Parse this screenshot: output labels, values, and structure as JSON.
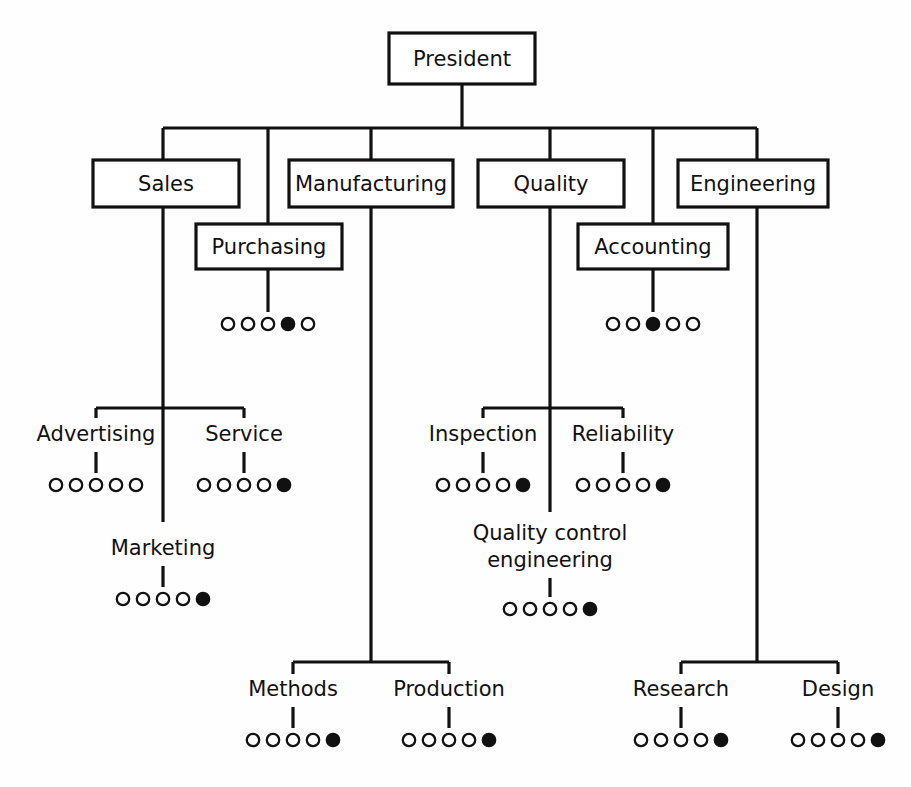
{
  "chart_data": {
    "type": "diagram",
    "diagram_type": "organization-chart",
    "line_color": "#111111",
    "box_fill": "#ffffff",
    "background": "#fefefe",
    "dot_legend": {
      "open_symbol": "open circle",
      "filled_symbol": "filled circle",
      "dots_per_group": 5
    },
    "root": {
      "id": "president",
      "label": "President",
      "style": "box"
    },
    "level2": [
      {
        "id": "sales",
        "label": "Sales",
        "style": "box"
      },
      {
        "id": "purchasing",
        "label": "Purchasing",
        "style": "box"
      },
      {
        "id": "manufacturing",
        "label": "Manufacturing",
        "style": "box"
      },
      {
        "id": "quality",
        "label": "Quality",
        "style": "box"
      },
      {
        "id": "accounting",
        "label": "Accounting",
        "style": "box"
      },
      {
        "id": "engineering",
        "label": "Engineering",
        "style": "box"
      }
    ],
    "leaves": [
      {
        "id": "purchasing-rating",
        "parent": "purchasing",
        "label": "",
        "dots": 5,
        "filled_index": 4
      },
      {
        "id": "accounting-rating",
        "parent": "accounting",
        "label": "",
        "dots": 5,
        "filled_index": 3
      },
      {
        "id": "advertising",
        "parent": "sales",
        "label": "Advertising",
        "dots": 5,
        "filled_index": 0
      },
      {
        "id": "service",
        "parent": "sales",
        "label": "Service",
        "dots": 5,
        "filled_index": 5
      },
      {
        "id": "marketing",
        "parent": "sales",
        "label": "Marketing",
        "dots": 5,
        "filled_index": 5
      },
      {
        "id": "inspection",
        "parent": "quality",
        "label": "Inspection",
        "dots": 5,
        "filled_index": 5
      },
      {
        "id": "reliability",
        "parent": "quality",
        "label": "Reliability",
        "dots": 5,
        "filled_index": 5
      },
      {
        "id": "quality-control",
        "parent": "quality",
        "label": "Quality control engineering",
        "dots": 5,
        "filled_index": 5
      },
      {
        "id": "methods",
        "parent": "manufacturing",
        "label": "Methods",
        "dots": 5,
        "filled_index": 5
      },
      {
        "id": "production",
        "parent": "manufacturing",
        "label": "Production",
        "dots": 5,
        "filled_index": 5
      },
      {
        "id": "research",
        "parent": "engineering",
        "label": "Research",
        "dots": 5,
        "filled_index": 5
      },
      {
        "id": "design",
        "parent": "engineering",
        "label": "Design",
        "dots": 5,
        "filled_index": 5
      }
    ]
  },
  "labels": {
    "president": "President",
    "sales": "Sales",
    "purchasing": "Purchasing",
    "manufacturing": "Manufacturing",
    "quality": "Quality",
    "accounting": "Accounting",
    "engineering": "Engineering",
    "advertising": "Advertising",
    "service": "Service",
    "marketing": "Marketing",
    "inspection": "Inspection",
    "reliability": "Reliability",
    "quality_control_line1": "Quality control",
    "quality_control_line2": "engineering",
    "methods": "Methods",
    "production": "Production",
    "research": "Research",
    "design": "Design"
  },
  "geometry": {
    "boxes": {
      "president": {
        "x": 389,
        "y": 33,
        "w": 146,
        "h": 51
      },
      "sales": {
        "x": 93,
        "y": 160,
        "w": 146,
        "h": 47
      },
      "purchasing": {
        "x": 196,
        "y": 224,
        "w": 146,
        "h": 45
      },
      "manufacturing": {
        "x": 289,
        "y": 160,
        "w": 164,
        "h": 47
      },
      "quality": {
        "x": 478,
        "y": 160,
        "w": 146,
        "h": 47
      },
      "accounting": {
        "x": 578,
        "y": 224,
        "w": 150,
        "h": 45
      },
      "engineering": {
        "x": 678,
        "y": 160,
        "w": 150,
        "h": 47
      }
    },
    "bus_y": 128,
    "drops": {
      "sales": 163,
      "purchasing": 268,
      "manufacturing": 371,
      "quality": 550,
      "accounting": 653,
      "engineering": 757
    }
  }
}
